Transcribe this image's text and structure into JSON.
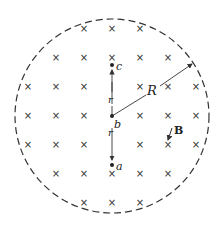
{
  "diagram": {
    "region": {
      "shape": "circle",
      "style": "dashed",
      "center": [
        112,
        116
      ],
      "radius": 97
    },
    "field_symbol": "×",
    "field_label": "B",
    "radius_label": "R",
    "points": [
      {
        "id": "c",
        "label": "c",
        "x": 112,
        "y": 65
      },
      {
        "id": "b",
        "label": "b",
        "x": 112,
        "y": 116
      },
      {
        "id": "a",
        "label": "a",
        "x": 112,
        "y": 165
      }
    ],
    "distance_labels": [
      {
        "label": "r",
        "between": "b-c"
      },
      {
        "label": "r",
        "between": "b-a"
      }
    ],
    "crosses": [
      [
        84,
        29
      ],
      [
        112,
        29
      ],
      [
        140,
        29
      ],
      [
        56,
        58
      ],
      [
        84,
        58
      ],
      [
        112,
        58
      ],
      [
        140,
        58
      ],
      [
        168,
        58
      ],
      [
        28,
        87
      ],
      [
        56,
        87
      ],
      [
        84,
        87
      ],
      [
        140,
        87
      ],
      [
        168,
        87
      ],
      [
        196,
        87
      ],
      [
        28,
        116
      ],
      [
        56,
        116
      ],
      [
        84,
        116
      ],
      [
        140,
        116
      ],
      [
        168,
        116
      ],
      [
        196,
        116
      ],
      [
        28,
        145
      ],
      [
        56,
        145
      ],
      [
        84,
        145
      ],
      [
        140,
        145
      ],
      [
        168,
        145
      ],
      [
        196,
        145
      ],
      [
        56,
        174
      ],
      [
        84,
        174
      ],
      [
        112,
        174
      ],
      [
        140,
        174
      ],
      [
        168,
        174
      ],
      [
        84,
        203
      ],
      [
        112,
        203
      ],
      [
        140,
        203
      ]
    ]
  }
}
